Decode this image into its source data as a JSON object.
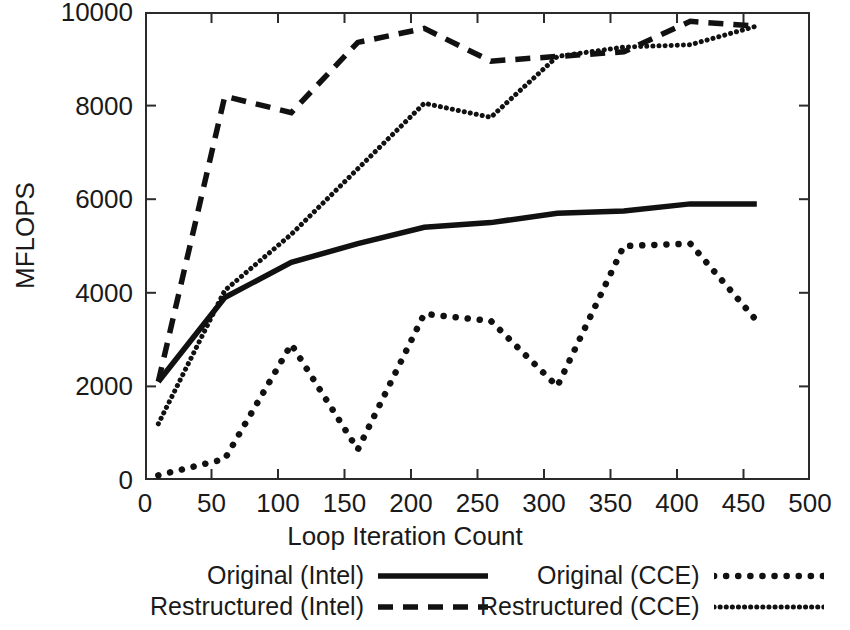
{
  "chart_data": {
    "type": "line",
    "title": "",
    "xlabel": "Loop Iteration Count",
    "ylabel": "MFLOPS",
    "xlim": [
      0,
      500
    ],
    "ylim": [
      0,
      10000
    ],
    "xticks": [
      0,
      50,
      100,
      150,
      200,
      250,
      300,
      350,
      400,
      450,
      500
    ],
    "yticks": [
      0,
      2000,
      4000,
      6000,
      8000,
      10000
    ],
    "xtick_labels": [
      "0",
      "50",
      "100",
      "150",
      "200",
      "250",
      "300",
      "350",
      "400",
      "450",
      "500"
    ],
    "ytick_labels": [
      "0",
      "2000",
      "4000",
      "6000",
      "8000",
      "10000"
    ],
    "grid": false,
    "legend_position": "below-axes",
    "line_color": "#111111",
    "series": [
      {
        "name": "Original (Intel)",
        "style": "solid",
        "x": [
          10,
          60,
          110,
          160,
          210,
          260,
          310,
          360,
          410,
          460
        ],
        "values": [
          2100,
          3900,
          4650,
          5050,
          5400,
          5500,
          5700,
          5750,
          5900,
          5900
        ]
      },
      {
        "name": "Restructured (Intel)",
        "style": "dashed",
        "x": [
          10,
          60,
          110,
          160,
          210,
          260,
          310,
          360,
          410,
          460
        ],
        "values": [
          2100,
          8200,
          7850,
          9350,
          9650,
          8950,
          9050,
          9150,
          9800,
          9700
        ]
      },
      {
        "name": "Original (CCE)",
        "style": "dotted",
        "x": [
          10,
          60,
          110,
          160,
          210,
          260,
          310,
          360,
          410,
          460
        ],
        "values": [
          100,
          450,
          2900,
          650,
          3550,
          3400,
          2000,
          5000,
          5050,
          3400
        ]
      },
      {
        "name": "Restructured (CCE)",
        "style": "fine-dotted",
        "x": [
          10,
          60,
          110,
          160,
          210,
          260,
          310,
          360,
          410,
          460
        ],
        "values": [
          1200,
          4050,
          5250,
          6650,
          8050,
          7750,
          9050,
          9250,
          9300,
          9700
        ]
      }
    ]
  },
  "legend": {
    "entries": [
      {
        "label": "Original (Intel)",
        "style": "solid"
      },
      {
        "label": "Restructured (Intel)",
        "style": "dashed"
      },
      {
        "label": "Original (CCE)",
        "style": "dotted"
      },
      {
        "label": "Restructured (CCE)",
        "style": "fine-dotted"
      }
    ]
  }
}
